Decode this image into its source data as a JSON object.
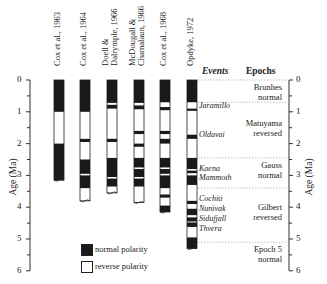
{
  "chart_data": {
    "type": "table",
    "title": "",
    "ylabel": "Age (Ma)",
    "ylim": [
      0,
      6
    ],
    "yticks": [
      0,
      1,
      2,
      3,
      4,
      5,
      6
    ],
    "grid": false,
    "legend_position": "bottom-center",
    "legend": [
      {
        "label": "normal polarity",
        "color": "#1a1a1a"
      },
      {
        "label": "reverse polarity",
        "color": "#ffffff"
      }
    ],
    "columns": [
      {
        "name": "Cox et al., 1963",
        "bottom": 3.15,
        "normal": [
          [
            0,
            1.0
          ],
          [
            2.0,
            3.15
          ]
        ]
      },
      {
        "name": "Cox et al., 1964",
        "bottom": 3.8,
        "normal": [
          [
            0,
            1.0
          ],
          [
            1.85,
            1.95
          ],
          [
            2.5,
            2.95
          ],
          [
            3.0,
            3.4
          ]
        ]
      },
      {
        "name": "Doell & Dalrymple, 1966",
        "bottom": 3.55,
        "normal": [
          [
            0,
            0.72
          ],
          [
            0.78,
            0.9
          ],
          [
            1.85,
            1.95
          ],
          [
            2.45,
            3.05
          ],
          [
            3.1,
            3.35
          ]
        ]
      },
      {
        "name": "McDougall & Chamalaun, 1966",
        "bottom": 3.85,
        "normal": [
          [
            0,
            0.72
          ],
          [
            0.8,
            0.92
          ],
          [
            1.6,
            1.7
          ],
          [
            2.0,
            2.1
          ],
          [
            2.45,
            2.75
          ],
          [
            2.8,
            3.05
          ],
          [
            3.1,
            3.35
          ]
        ]
      },
      {
        "name": "Cox et al., 1968",
        "bottom": 4.15,
        "normal": [
          [
            0,
            0.7
          ],
          [
            0.85,
            0.95
          ],
          [
            1.6,
            1.7
          ],
          [
            1.85,
            2.0
          ],
          [
            2.45,
            2.75
          ],
          [
            2.8,
            2.95
          ],
          [
            3.0,
            3.4
          ],
          [
            3.6,
            3.7
          ],
          [
            3.95,
            4.15
          ]
        ]
      },
      {
        "name": "Opdyke, 1972",
        "bottom": 5.3,
        "normal": [
          [
            0,
            0.7
          ],
          [
            0.9,
            0.97
          ],
          [
            1.72,
            1.85
          ],
          [
            2.45,
            2.8
          ],
          [
            2.85,
            2.93
          ],
          [
            3.0,
            3.3
          ],
          [
            3.8,
            3.9
          ],
          [
            4.05,
            4.25
          ],
          [
            4.32,
            4.45
          ],
          [
            4.48,
            4.62
          ],
          [
            4.95,
            5.3
          ]
        ]
      }
    ],
    "events": [
      {
        "name": "Jaramillo",
        "age": 0.93
      },
      {
        "name": "Olduvai",
        "age": 1.8
      },
      {
        "name": "Kaena",
        "age": 2.85
      },
      {
        "name": "Mammoth",
        "age": 3.05
      },
      {
        "name": "Cochiti",
        "age": 3.85
      },
      {
        "name": "Nunivak",
        "age": 4.1
      },
      {
        "name": "Sidufjall",
        "age": 4.35
      },
      {
        "name": "Thvera",
        "age": 4.55
      }
    ],
    "epochs": [
      {
        "name": "Brunhes",
        "polarity": "normal",
        "from": 0,
        "to": 0.7
      },
      {
        "name": "Matuyama",
        "polarity": "reversed",
        "from": 0.7,
        "to": 2.45
      },
      {
        "name": "Gauss",
        "polarity": "normal",
        "from": 2.45,
        "to": 3.4
      },
      {
        "name": "Gilbert",
        "polarity": "reversed",
        "from": 3.4,
        "to": 5.1
      },
      {
        "name": "Epoch 5",
        "polarity": "normal",
        "from": 5.1,
        "to": 5.5
      }
    ]
  },
  "headers": {
    "events": "Events",
    "epochs": "Epochs"
  },
  "axis": {
    "left_title": "Age (Ma)",
    "right_title": "Age (Ma)",
    "ticks": [
      "0",
      "1",
      "2",
      "3",
      "4",
      "5",
      "6"
    ]
  },
  "legend": {
    "normal": "normal polarity",
    "reverse": "reverse polarity"
  },
  "columns": [
    "Cox et al., 1963",
    "Cox et al., 1964",
    "Doell & Dalrymple, 1966",
    "McDougall & Chamalaun, 1966",
    "Cox et al., 1968",
    "Opdyke, 1972"
  ],
  "epoch_labels": [
    {
      "l1": "Brunhes",
      "l2": "normal"
    },
    {
      "l1": "Matuyama",
      "l2": "reversed"
    },
    {
      "l1": "Gauss",
      "l2": "normal"
    },
    {
      "l1": "Gilbert",
      "l2": "reversed"
    },
    {
      "l1": "Epoch 5",
      "l2": "normal"
    }
  ],
  "event_labels": [
    "Jaramillo",
    "Olduvai",
    "Kaena",
    "Mammoth",
    "Cochiti",
    "Nunivak",
    "Sidufjall",
    "Thvera"
  ]
}
